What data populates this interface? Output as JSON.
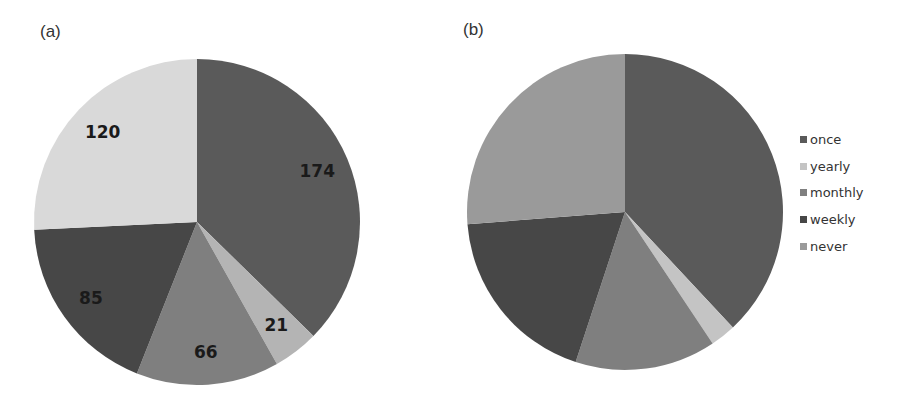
{
  "panels": {
    "a": {
      "label": "(a)"
    },
    "b": {
      "label": "(b)"
    }
  },
  "legend": {
    "items": [
      {
        "label": "once",
        "color": "#5a5a5a"
      },
      {
        "label": "yearly",
        "color": "#c4c4c4"
      },
      {
        "label": "monthly",
        "color": "#7f7f7f"
      },
      {
        "label": "weekly",
        "color": "#474747"
      },
      {
        "label": "never",
        "color": "#9a9a9a"
      }
    ]
  },
  "chart_data": [
    {
      "type": "pie",
      "title": "(a)",
      "categories": [
        "once",
        "yearly",
        "monthly",
        "weekly",
        "never"
      ],
      "values": [
        174,
        21,
        66,
        85,
        120
      ],
      "data_labels": [
        "174",
        "21",
        "66",
        "85",
        "120"
      ],
      "colors": [
        "#5a5a5a",
        "#b4b4b4",
        "#7f7f7f",
        "#474747",
        "#d9d9d9"
      ],
      "start_angle": "12 o'clock",
      "direction": "clockwise",
      "legend": false
    },
    {
      "type": "pie",
      "title": "(b)",
      "categories": [
        "once",
        "yearly",
        "monthly",
        "weekly",
        "never"
      ],
      "values_percent_estimated": [
        38.0,
        2.6,
        14.4,
        18.7,
        26.2
      ],
      "data_labels": [],
      "colors": [
        "#5a5a5a",
        "#c4c4c4",
        "#7f7f7f",
        "#474747",
        "#9a9a9a"
      ],
      "start_angle": "12 o'clock",
      "direction": "clockwise",
      "legend": true,
      "legend_position": "right"
    }
  ]
}
